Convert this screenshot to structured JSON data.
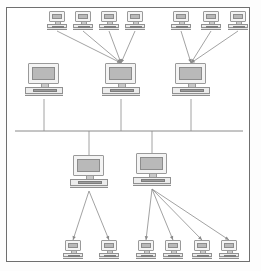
{
  "diagram": {
    "background_color": "#ffffff",
    "frame_color": "#6f6f6f",
    "line_color": "#8a8a8a",
    "screen_color": "#b9b9b9",
    "case_color": "#f4f4f4",
    "keyboard_color": "#9e9e9e",
    "node_counts": {
      "backbone_servers": 3,
      "lower_servers": 2,
      "top_left_workstations": 4,
      "top_right_workstations": 3,
      "bottom_left_workstations": 2,
      "bottom_right_workstations": 4,
      "total_nodes": 18
    },
    "backbone": {
      "label": "network-bus",
      "y": 131,
      "x_start": 15,
      "x_end": 243
    },
    "nodes": [
      {
        "id": "ws-t1",
        "group": "top-left-workstations",
        "role": "workstation",
        "size": "small",
        "x": 47,
        "y": 11
      },
      {
        "id": "ws-t2",
        "group": "top-left-workstations",
        "role": "workstation",
        "size": "small",
        "x": 73,
        "y": 11
      },
      {
        "id": "ws-t3",
        "group": "top-left-workstations",
        "role": "workstation",
        "size": "small",
        "x": 99,
        "y": 11
      },
      {
        "id": "ws-t4",
        "group": "top-left-workstations",
        "role": "workstation",
        "size": "small",
        "x": 125,
        "y": 11
      },
      {
        "id": "ws-t5",
        "group": "top-right-workstations",
        "role": "workstation",
        "size": "small",
        "x": 171,
        "y": 11
      },
      {
        "id": "ws-t6",
        "group": "top-right-workstations",
        "role": "workstation",
        "size": "small",
        "x": 201,
        "y": 11
      },
      {
        "id": "ws-t7",
        "group": "top-right-workstations",
        "role": "workstation",
        "size": "small",
        "x": 228,
        "y": 11
      },
      {
        "id": "srv-left",
        "group": "backbone-servers",
        "role": "server",
        "size": "large",
        "x": 25,
        "y": 63
      },
      {
        "id": "srv-center",
        "group": "backbone-servers",
        "role": "server",
        "size": "large",
        "x": 102,
        "y": 63
      },
      {
        "id": "srv-right",
        "group": "backbone-servers",
        "role": "server",
        "size": "large",
        "x": 172,
        "y": 63
      },
      {
        "id": "srv-lower-left",
        "group": "lower-servers",
        "role": "server",
        "size": "large",
        "x": 70,
        "y": 155
      },
      {
        "id": "srv-lower-right",
        "group": "lower-servers",
        "role": "server",
        "size": "large",
        "x": 133,
        "y": 153
      },
      {
        "id": "ws-b1",
        "group": "bottom-left-workstations",
        "role": "workstation",
        "size": "small",
        "x": 63,
        "y": 240
      },
      {
        "id": "ws-b2",
        "group": "bottom-left-workstations",
        "role": "workstation",
        "size": "small",
        "x": 99,
        "y": 240
      },
      {
        "id": "ws-b3",
        "group": "bottom-right-workstations",
        "role": "workstation",
        "size": "small",
        "x": 136,
        "y": 240
      },
      {
        "id": "ws-b4",
        "group": "bottom-right-workstations",
        "role": "workstation",
        "size": "small",
        "x": 163,
        "y": 240
      },
      {
        "id": "ws-b5",
        "group": "bottom-right-workstations",
        "role": "workstation",
        "size": "small",
        "x": 192,
        "y": 240
      },
      {
        "id": "ws-b6",
        "group": "bottom-right-workstations",
        "role": "workstation",
        "size": "small",
        "x": 219,
        "y": 240
      }
    ],
    "links": [
      {
        "from": "ws-t1",
        "to": "srv-center",
        "kind": "arrow"
      },
      {
        "from": "ws-t2",
        "to": "srv-center",
        "kind": "arrow"
      },
      {
        "from": "ws-t3",
        "to": "srv-center",
        "kind": "arrow"
      },
      {
        "from": "ws-t4",
        "to": "srv-center",
        "kind": "arrow"
      },
      {
        "from": "ws-t5",
        "to": "srv-right",
        "kind": "arrow"
      },
      {
        "from": "ws-t6",
        "to": "srv-right",
        "kind": "arrow"
      },
      {
        "from": "ws-t7",
        "to": "srv-right",
        "kind": "arrow"
      },
      {
        "from": "srv-left",
        "to": "network-bus",
        "kind": "drop"
      },
      {
        "from": "srv-center",
        "to": "network-bus",
        "kind": "drop"
      },
      {
        "from": "srv-right",
        "to": "network-bus",
        "kind": "drop"
      },
      {
        "from": "network-bus",
        "to": "srv-lower-left",
        "kind": "drop"
      },
      {
        "from": "network-bus",
        "to": "srv-lower-right",
        "kind": "drop"
      },
      {
        "from": "srv-lower-left",
        "to": "ws-b1",
        "kind": "arrow"
      },
      {
        "from": "srv-lower-left",
        "to": "ws-b2",
        "kind": "arrow"
      },
      {
        "from": "srv-lower-right",
        "to": "ws-b3",
        "kind": "arrow"
      },
      {
        "from": "srv-lower-right",
        "to": "ws-b4",
        "kind": "arrow"
      },
      {
        "from": "srv-lower-right",
        "to": "ws-b5",
        "kind": "arrow"
      },
      {
        "from": "srv-lower-right",
        "to": "ws-b6",
        "kind": "arrow"
      }
    ]
  }
}
